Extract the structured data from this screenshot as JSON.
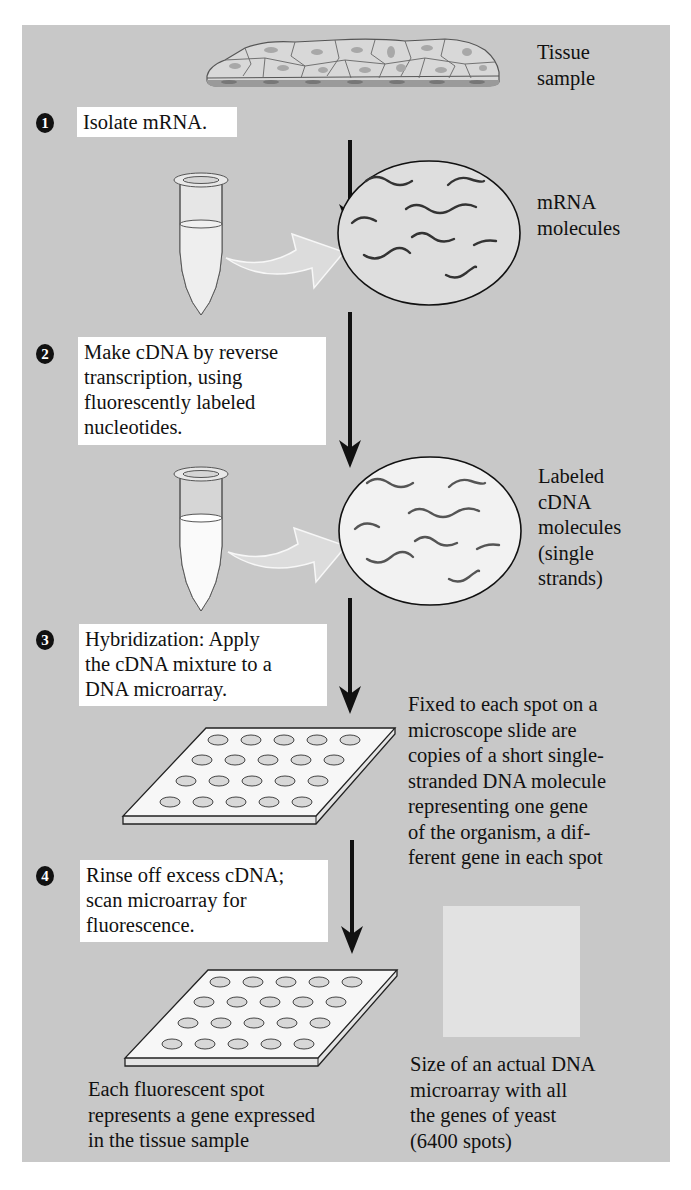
{
  "figure": {
    "background_color": "#c8c8c8",
    "box_color": "#ffffff",
    "ink_color": "#111111",
    "tissue_label": [
      "Tissue",
      "sample"
    ],
    "steps": [
      {
        "number": "1",
        "lines": [
          "Isolate mRNA."
        ]
      },
      {
        "number": "2",
        "lines": [
          "Make cDNA by reverse",
          "transcription, using",
          "fluorescently labeled",
          "nucleotides."
        ]
      },
      {
        "number": "3",
        "lines": [
          "Hybridization: Apply",
          "the cDNA mixture to a",
          "DNA microarray."
        ]
      },
      {
        "number": "4",
        "lines": [
          "Rinse off excess cDNA;",
          "scan microarray for",
          "fluorescence."
        ]
      }
    ],
    "mrna_label": [
      "mRNA",
      "molecules"
    ],
    "cdna_label": [
      "Labeled",
      "cDNA",
      "molecules",
      "(single",
      "strands)"
    ],
    "microarray_note": [
      "Fixed to each spot on a",
      "microscope slide are",
      "copies of a short single-",
      "stranded DNA molecule",
      "representing one gene",
      "of the organism, a dif-",
      "ferent gene in each spot"
    ],
    "spot_caption": [
      "Each fluorescent spot",
      "represents a gene expressed",
      "in the tissue sample"
    ],
    "yeast_caption": [
      "Size of an actual DNA",
      "microarray with all",
      "the genes of yeast",
      "(6400 spots)"
    ],
    "microarray_grid": {
      "rows": 4,
      "cols": 5
    },
    "icons": [
      "tissue-sample-icon",
      "test-tube-icon",
      "curved-arrow-icon",
      "molecule-circle-icon",
      "down-arrow-icon",
      "microarray-slide-icon",
      "yeast-microarray-square"
    ]
  }
}
